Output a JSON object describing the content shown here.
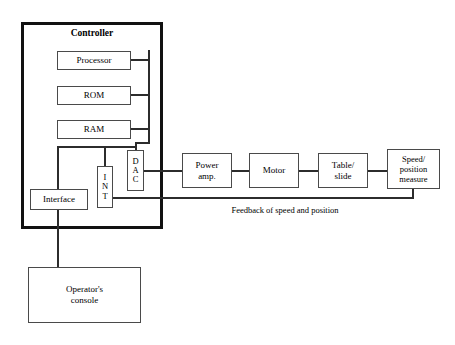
{
  "diagram": {
    "controller": {
      "label": "Controller",
      "blocks": {
        "processor": "Processor",
        "rom": "ROM",
        "ram": "RAM",
        "dac": "D A C",
        "dac_letters": [
          "D",
          "A",
          "C"
        ],
        "int": "I N T",
        "int_letters": [
          "I",
          "N",
          "T"
        ],
        "interface": "Interface"
      }
    },
    "console": {
      "line1": "Operator's",
      "line2": "console"
    },
    "drive_chain": [
      {
        "id": "power-amp",
        "line1": "Power",
        "line2": "amp."
      },
      {
        "id": "motor",
        "line1": "Motor",
        "line2": ""
      },
      {
        "id": "table-slide",
        "line1": "Table/",
        "line2": "slide"
      },
      {
        "id": "speed-position",
        "line1": "Speed/",
        "line2": "position",
        "line3": "measure"
      }
    ],
    "feedback_label": "Feedback of speed and position",
    "colors": {
      "background": "#ffffff",
      "box_border": "#4a4a4a",
      "enclosure_border": "#111111",
      "line": "#2c2c2c",
      "text": "#000000"
    }
  }
}
